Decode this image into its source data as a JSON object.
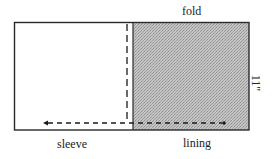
{
  "diagram": {
    "labels": {
      "top": "fold",
      "left_bottom": "sleeve",
      "right_bottom": "lining",
      "side_measure": "11\""
    },
    "colors": {
      "outline": "#2a2a2a",
      "shade": "#b9b9b9",
      "background": "#ffffff"
    },
    "regions": [
      {
        "name": "sleeve",
        "fill": "none"
      },
      {
        "name": "lining",
        "fill": "shaded"
      }
    ]
  }
}
